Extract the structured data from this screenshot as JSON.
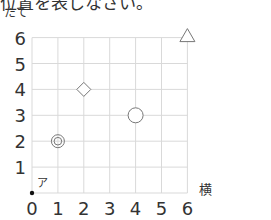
{
  "header": {
    "text": "位置を表しなさい。"
  },
  "chart_data": {
    "type": "scatter",
    "title": "",
    "xlabel": "横",
    "ylabel": "たて",
    "xlim": [
      0,
      6
    ],
    "ylim": [
      0,
      6
    ],
    "x_ticks": [
      "0",
      "1",
      "2",
      "3",
      "4",
      "5",
      "6"
    ],
    "y_ticks": [
      "1",
      "2",
      "3",
      "4",
      "5",
      "6"
    ],
    "grid": true,
    "points": [
      {
        "label": "ア",
        "marker": "dot",
        "x": 0,
        "y": 0
      },
      {
        "label": "◎",
        "marker": "double-circle",
        "x": 1,
        "y": 2
      },
      {
        "label": "◇",
        "marker": "diamond",
        "x": 2,
        "y": 4
      },
      {
        "label": "○",
        "marker": "circle",
        "x": 4,
        "y": 3
      },
      {
        "label": "△",
        "marker": "triangle",
        "x": 6,
        "y": 6
      }
    ]
  },
  "colors": {
    "grid": "#d9d9d9",
    "marker": "#777777",
    "text": "#333333"
  }
}
